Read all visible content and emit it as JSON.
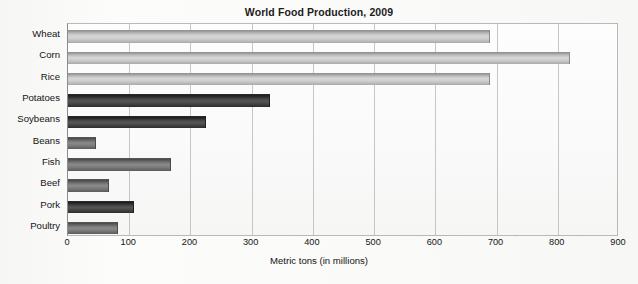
{
  "chart_data": {
    "type": "bar",
    "orientation": "horizontal",
    "title": "World Food Production, 2009",
    "xlabel": "Metric tons (in millions)",
    "ylabel": "",
    "xlim": [
      0,
      900
    ],
    "xticks": [
      0,
      100,
      200,
      300,
      400,
      500,
      600,
      700,
      800,
      900
    ],
    "grid": "vertical",
    "legend": "none",
    "categories": [
      "Wheat",
      "Corn",
      "Rice",
      "Potatoes",
      "Soybeans",
      "Beans",
      "Fish",
      "Beef",
      "Pork",
      "Poultry"
    ],
    "values": [
      690,
      820,
      690,
      330,
      225,
      45,
      168,
      67,
      107,
      82
    ],
    "bar_styles": [
      "light",
      "light",
      "light",
      "dark",
      "dark",
      "mid",
      "mid",
      "mid",
      "dark",
      "mid"
    ],
    "colors": {
      "bar_light": "#bdbdbd",
      "bar_mid": "#6e6e6e",
      "bar_dark": "#414141",
      "gridline": "#c6c6c6",
      "plot_border": "#b9b9b9",
      "text": "#141414",
      "background": "#fbfbfa"
    }
  },
  "ghost_text": [
    "World Food Production",
    "Metric tons",
    "in millions",
    "production"
  ]
}
